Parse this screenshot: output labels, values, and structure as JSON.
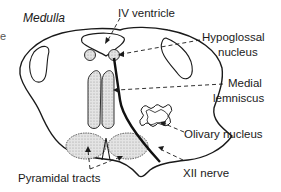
{
  "diagram": {
    "title": "Medulla",
    "edge_fragment": "e",
    "labels": {
      "iv_ventricle": "IV ventricle",
      "hypoglossal_line1": "Hypoglossal",
      "hypoglossal_line2": "nucleus",
      "medial_line1": "Medial",
      "medial_line2": "lemniscus",
      "olivary": "Olivary nucleus",
      "xii_nerve": "XII nerve",
      "pyramidal": "Pyramidal tracts"
    },
    "colors": {
      "outline": "#1a1a1a",
      "stipple_fill": "#dcdcdc",
      "background": "#ffffff"
    }
  }
}
